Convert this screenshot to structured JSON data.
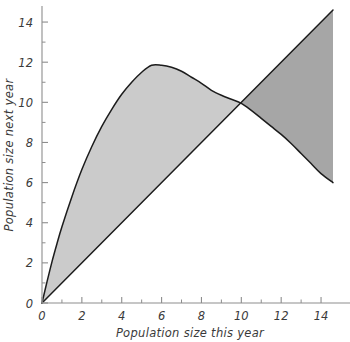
{
  "chart_data": {
    "type": "line",
    "title": "",
    "xlabel": "Population size this year",
    "ylabel": "Population size next year",
    "xlim": [
      0,
      14.6
    ],
    "ylim": [
      0,
      14.8
    ],
    "grid": false,
    "legend": "none",
    "x_ticks_major": [
      0,
      2,
      4,
      6,
      8,
      10,
      12,
      14
    ],
    "x_tick_labels": [
      "0",
      "2",
      "4",
      "6",
      "8",
      "10",
      "12",
      "14"
    ],
    "x_ticks_minor": [
      1,
      3,
      5,
      7,
      9,
      11,
      13
    ],
    "y_ticks_major": [
      0,
      2,
      4,
      6,
      8,
      10,
      12,
      14
    ],
    "y_tick_labels": [
      "0",
      "2",
      "4",
      "6",
      "8",
      "10",
      "12",
      "14"
    ],
    "y_ticks_minor": [
      1,
      3,
      5,
      7,
      9,
      11,
      13
    ],
    "series": [
      {
        "name": "recruitment-curve",
        "type": "line",
        "color": "#1c1c1c",
        "x": [
          0,
          0.25,
          0.5,
          0.75,
          1,
          1.5,
          2,
          2.5,
          3,
          3.5,
          4,
          4.5,
          5,
          5.5,
          6,
          6.5,
          7,
          7.5,
          8,
          8.5,
          9,
          9.5,
          10,
          10.5,
          11,
          11.5,
          12,
          12.5,
          13,
          13.5,
          14,
          14.6
        ],
        "y": [
          0,
          1.05,
          2.05,
          2.95,
          3.8,
          5.3,
          6.65,
          7.8,
          8.8,
          9.65,
          10.4,
          11.0,
          11.5,
          11.85,
          11.85,
          11.75,
          11.55,
          11.25,
          10.95,
          10.6,
          10.35,
          10.15,
          9.95,
          9.6,
          9.2,
          8.8,
          8.4,
          7.95,
          7.45,
          6.95,
          6.45,
          6.0
        ]
      },
      {
        "name": "replacement-line",
        "type": "line",
        "color": "#1c1c1c",
        "x": [
          0,
          14.6
        ],
        "y": [
          0,
          14.6
        ]
      }
    ],
    "fills": [
      {
        "name": "growth-region",
        "description": "region where next-year size exceeds this-year size",
        "color": "#cbcbcb",
        "between": [
          "recruitment-curve",
          "replacement-line"
        ],
        "x_range": [
          0,
          10
        ]
      },
      {
        "name": "decline-region",
        "description": "region where this-year size exceeds next-year size",
        "color": "#a6a6a6",
        "between": [
          "replacement-line",
          "recruitment-curve"
        ],
        "x_range": [
          10,
          14.6
        ]
      }
    ],
    "annotations": [
      {
        "name": "equilibrium-crossing",
        "x": 10.0,
        "y": 10.0
      }
    ]
  }
}
